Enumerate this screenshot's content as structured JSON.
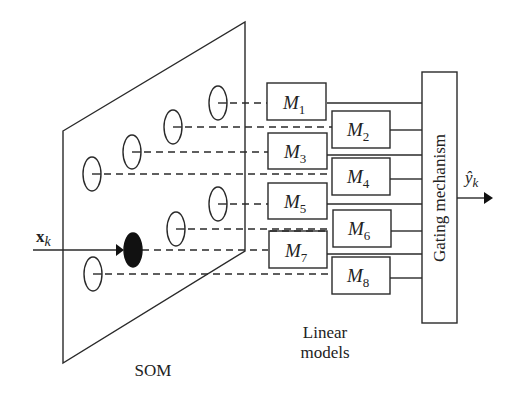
{
  "diagram": {
    "input_label": "x",
    "input_subscript": "k",
    "output_label": "ŷ",
    "output_subscript": "k",
    "som_label": "SOM",
    "linear_models_label_line1": "Linear",
    "linear_models_label_line2": "models",
    "gating_label": "Gating mechanism",
    "models": [
      {
        "name": "M",
        "sub": "1"
      },
      {
        "name": "M",
        "sub": "2"
      },
      {
        "name": "M",
        "sub": "3"
      },
      {
        "name": "M",
        "sub": "4"
      },
      {
        "name": "M",
        "sub": "5"
      },
      {
        "name": "M",
        "sub": "6"
      },
      {
        "name": "M",
        "sub": "7"
      },
      {
        "name": "M",
        "sub": "8"
      }
    ],
    "som_nodes": 8,
    "winning_node_index": 6
  }
}
